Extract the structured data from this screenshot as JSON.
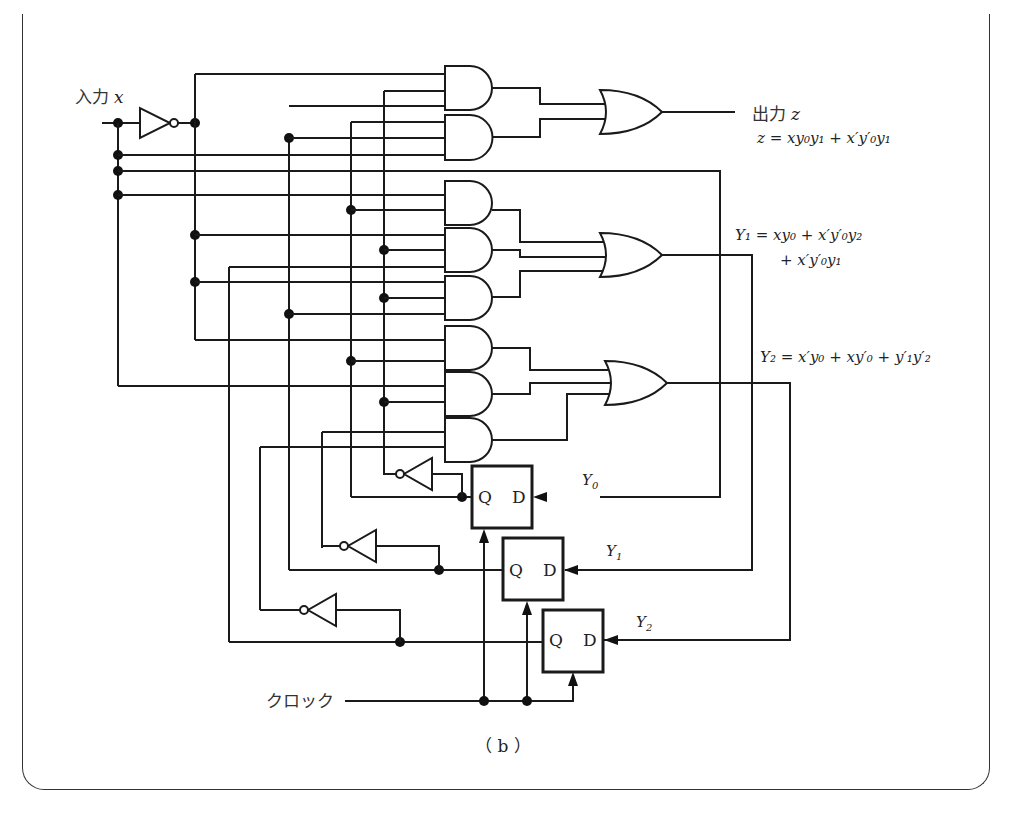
{
  "figure": {
    "caption": "（ b ）",
    "input_label": "入力",
    "input_var": "x",
    "output_label": "出力",
    "output_var": "z",
    "clock_label": "クロック"
  },
  "equations": {
    "z": "z = xy₀y₁ + x′y′₀y₁",
    "y1_line1": "Y₁ = xy₀ + x′y′₀y₂",
    "y1_line2": "+ x′y′₀y₁",
    "y2": "Y₂ = x′y₀ + xy′₀ + y′₁y′₂"
  },
  "flipflops": [
    {
      "name": "Y0",
      "q_label": "Q",
      "d_label": "D",
      "input_label": "Y₀"
    },
    {
      "name": "Y1",
      "q_label": "Q",
      "d_label": "D",
      "input_label": "Y₁"
    },
    {
      "name": "Y2",
      "q_label": "Q",
      "d_label": "D",
      "input_label": "Y₂"
    }
  ],
  "gates": {
    "and_count": 8,
    "or_count": 3,
    "not_count": 4
  },
  "colors": {
    "line": "#1a1a1a",
    "background": "#ffffff"
  }
}
